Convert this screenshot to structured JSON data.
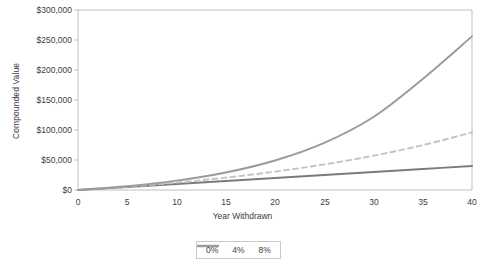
{
  "chart_data": {
    "type": "line",
    "title": "",
    "xlabel": "Year Withdrawn",
    "ylabel": "Compounded Value",
    "xlim": [
      0,
      40
    ],
    "ylim": [
      0,
      300000
    ],
    "grid": false,
    "legend_position": "bottom",
    "x_ticks": [
      "0",
      "5",
      "10",
      "15",
      "20",
      "25",
      "30",
      "35",
      "40"
    ],
    "y_ticks": [
      "$300,000",
      "$250,000",
      "$200,000",
      "$150,000",
      "$100,000",
      "$50,000",
      "$0"
    ],
    "x": [
      0,
      5,
      10,
      15,
      20,
      25,
      30,
      35,
      40
    ],
    "series": [
      {
        "name": "0%",
        "label": "0%",
        "color": "#7b7b7b",
        "style": "solid",
        "values": [
          0,
          5000,
          10000,
          15000,
          20000,
          25000,
          30000,
          35000,
          40000
        ]
      },
      {
        "name": "4%",
        "label": "4%",
        "color": "#c4c4c4",
        "style": "dashed",
        "values": [
          0,
          5600,
          12400,
          20600,
          30600,
          42600,
          57200,
          74800,
          96000
        ]
      },
      {
        "name": "8%",
        "label": "8%",
        "color": "#9a9a9a",
        "style": "solid",
        "values": [
          0,
          6300,
          15600,
          29200,
          49200,
          78600,
          121700,
          185000,
          256000
        ]
      }
    ]
  },
  "axis": {
    "frame_color": "#bfbfbf",
    "tick_color": "#bfbfbf",
    "text_color": "#3c3c3c"
  },
  "legend": {
    "items": [
      {
        "label": "0%"
      },
      {
        "label": "4%"
      },
      {
        "label": "8%"
      }
    ]
  }
}
